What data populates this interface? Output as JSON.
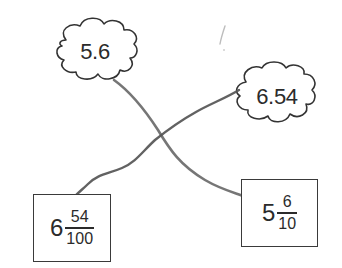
{
  "diagram": {
    "type": "matching-worksheet",
    "clouds": [
      {
        "id": "cloud-a",
        "value": "5.6",
        "cx": 95,
        "cy": 52
      },
      {
        "id": "cloud-b",
        "value": "6.54",
        "cx": 276,
        "cy": 97
      }
    ],
    "boxes": [
      {
        "id": "box-a",
        "whole": "6",
        "numerator": "54",
        "denominator": "100"
      },
      {
        "id": "box-b",
        "whole": "5",
        "numerator": "6",
        "denominator": "10"
      }
    ],
    "connections": [
      {
        "from": "5.6",
        "to": "5 6/10",
        "stroke": "#6e6e6e"
      },
      {
        "from": "6.54",
        "to": "6 54/100",
        "stroke": "#5a5a5a"
      }
    ],
    "colors": {
      "outline": "#3a3a3a",
      "text": "#2b2b2b",
      "pencil_line": "#646464",
      "background": "#ffffff"
    }
  }
}
